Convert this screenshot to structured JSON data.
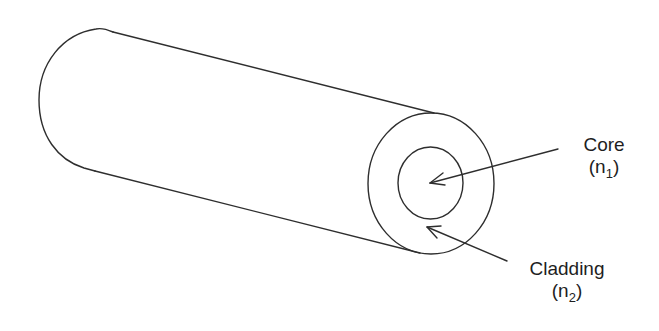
{
  "diagram": {
    "colors": {
      "stroke": "#2e2e2e",
      "text": "#1e1e1e",
      "background": "#ffffff"
    },
    "components": [
      {
        "id": "cylinder-body",
        "description": "Fiber body drawn as cylinder extending left"
      },
      {
        "id": "cladding",
        "label": "Cladding",
        "index_symbol": "n",
        "index_subscript": "2"
      },
      {
        "id": "core",
        "label": "Core",
        "index_symbol": "n",
        "index_subscript": "1"
      }
    ],
    "labels": {
      "core": {
        "title": "Core",
        "paren_open": "(",
        "symbol": "n",
        "subscript": "1",
        "paren_close": ")"
      },
      "cladding": {
        "title": "Cladding",
        "paren_open": "(",
        "symbol": "n",
        "subscript": "2",
        "paren_close": ")"
      }
    }
  }
}
